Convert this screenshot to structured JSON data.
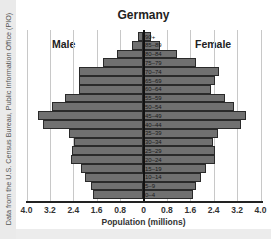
{
  "chart_data": {
    "type": "bar",
    "subtype": "population-pyramid",
    "title": "Germany",
    "xlabel": "Population (millions)",
    "ylabel": "",
    "source": "Data from the U.S. Census Bureau, Public Information Office (PIO)",
    "left_label": "Male",
    "right_label": "Female",
    "xlim": [
      -4.0,
      4.0
    ],
    "xticks": [
      "4.0",
      "3.2",
      "2.4",
      "1.6",
      "0.8",
      "0",
      "0.8",
      "1.6",
      "2.4",
      "3.2",
      "4.0"
    ],
    "grid": true,
    "categories": [
      "90+",
      "85–89",
      "80–84",
      "75–79",
      "70–74",
      "65–69",
      "60–64",
      "55–59",
      "50–54",
      "45–49",
      "40–44",
      "35–39",
      "30–34",
      "25–29",
      "20–24",
      "15–19",
      "10–14",
      "5–9",
      "0–4"
    ],
    "series": [
      {
        "name": "Male",
        "values": [
          0.19,
          0.41,
          0.89,
          1.37,
          2.2,
          2.22,
          2.2,
          2.7,
          3.12,
          3.59,
          3.42,
          2.56,
          2.39,
          2.43,
          2.47,
          2.15,
          2.0,
          1.81,
          1.72
        ]
      },
      {
        "name": "Female",
        "values": [
          0.26,
          0.58,
          1.13,
          1.78,
          2.59,
          2.43,
          2.31,
          2.77,
          3.08,
          3.49,
          3.35,
          2.53,
          2.38,
          2.43,
          2.44,
          2.12,
          1.98,
          1.78,
          1.7
        ]
      }
    ],
    "colors": {
      "bar": "#707070",
      "bar_border": "#2a2a2a",
      "grid": "#c8c8c8",
      "background": "#ffffff"
    }
  }
}
